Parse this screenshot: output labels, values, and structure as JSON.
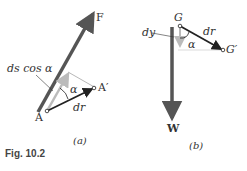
{
  "figure": {
    "caption": "Fig. 10.2",
    "panel_a": {
      "sublabel": "(a)",
      "force_label": "F",
      "point_start": "A",
      "point_end": "A′",
      "displacement_label": "dr",
      "angle_label": "α",
      "projection_label": "ds cos α"
    },
    "panel_b": {
      "sublabel": "(b)",
      "force_label": "W",
      "point_start": "G",
      "point_end": "G′",
      "displacement_label": "dr",
      "angle_label": "α",
      "vertical_label": "dy"
    },
    "colors": {
      "force_arrow": "#555555",
      "projection_arrow": "#bbbbbb",
      "displacement_arrow": "#222222",
      "construction_line": "#999999"
    }
  }
}
